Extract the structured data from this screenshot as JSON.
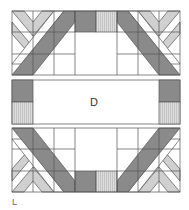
{
  "diagram": {
    "center_label": "D",
    "corner_label": "L",
    "colors": {
      "dark": "#8a8a8a",
      "light": "#cfcfcf",
      "stripe": "#d9d9d9",
      "line": "#555555",
      "background": "#ffffff"
    },
    "sections": [
      "top-block",
      "middle-band",
      "bottom-block"
    ]
  }
}
